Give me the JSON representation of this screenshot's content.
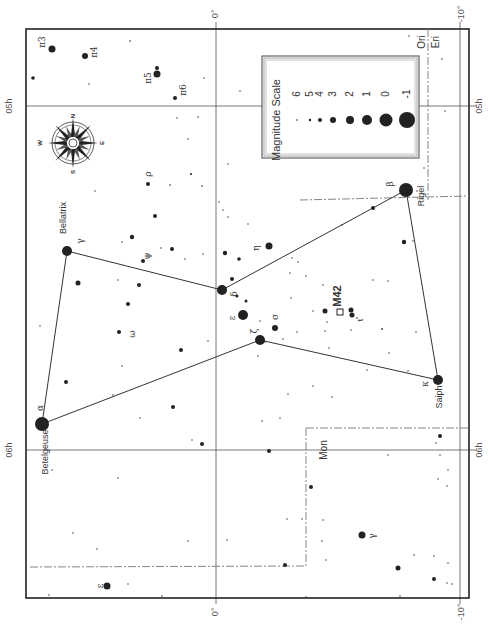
{
  "chart": {
    "constellation": "Orion",
    "frame": {
      "x": 26,
      "y": 29,
      "w": 443,
      "h": 569
    },
    "colors": {
      "ink": "#222222",
      "grid": "#555555",
      "boundary": "#777777",
      "paper": "#ffffff"
    }
  },
  "axes": {
    "dec_labels": [
      {
        "text": "0°",
        "x": 216,
        "y": 14,
        "rot": -90
      },
      {
        "text": "-10°",
        "x": 462,
        "y": 14,
        "rot": -90
      },
      {
        "text": "0°",
        "x": 216,
        "y": 612,
        "rot": -90
      },
      {
        "text": "-10°",
        "x": 462,
        "y": 612,
        "rot": -90
      }
    ],
    "ra_labels": [
      {
        "text": "05h",
        "x": 10,
        "y": 106,
        "rot": -90
      },
      {
        "text": "06h",
        "x": 10,
        "y": 450,
        "rot": -90
      },
      {
        "text": "05h",
        "x": 480,
        "y": 106,
        "rot": -90
      },
      {
        "text": "06h",
        "x": 480,
        "y": 450,
        "rot": -90
      }
    ],
    "grid_lines": [
      {
        "x1": 216,
        "y1": 22,
        "x2": 216,
        "y2": 604
      },
      {
        "x1": 26,
        "y1": 106,
        "x2": 476,
        "y2": 106
      },
      {
        "x1": 26,
        "y1": 450,
        "x2": 476,
        "y2": 450
      },
      {
        "x1": 460,
        "y1": 22,
        "x2": 460,
        "y2": 604
      }
    ]
  },
  "constellation_labels": [
    {
      "text": "Ori",
      "x": 422,
      "y": 42,
      "rot": -90
    },
    {
      "text": "Eri",
      "x": 436,
      "y": 42,
      "rot": -90
    },
    {
      "text": "Mon",
      "x": 324,
      "y": 450,
      "rot": -90
    }
  ],
  "boundaries": [
    {
      "points": "428,29 428,200"
    },
    {
      "points": "300,200 469,196"
    },
    {
      "points": "306,428 469,428"
    },
    {
      "points": "306,428 306,566"
    },
    {
      "points": "30,567 306,566"
    }
  ],
  "stick_lines": [
    {
      "from": "Betelgeuse",
      "to": "Bellatrix",
      "x1": 42,
      "y1": 424,
      "x2": 67,
      "y2": 251
    },
    {
      "from": "Bellatrix",
      "to": "Mintaka",
      "x1": 67,
      "y1": 251,
      "x2": 222,
      "y2": 290
    },
    {
      "from": "Mintaka",
      "to": "Rigel",
      "x1": 222,
      "y1": 290,
      "x2": 406,
      "y2": 190
    },
    {
      "from": "Rigel",
      "to": "Saiph",
      "x1": 406,
      "y1": 190,
      "x2": 438,
      "y2": 380
    },
    {
      "from": "Saiph",
      "to": "Alnitak",
      "x1": 438,
      "y1": 380,
      "x2": 260,
      "y2": 340
    },
    {
      "from": "Alnitak",
      "to": "Betelgeuse",
      "x1": 260,
      "y1": 340,
      "x2": 42,
      "y2": 424
    }
  ],
  "named_stars": [
    {
      "name": "Betelgeuse",
      "greek": "α",
      "x": 42,
      "y": 424,
      "r": 7,
      "label_x": 46,
      "label_y": 452,
      "greek_x": 40,
      "greek_y": 408
    },
    {
      "name": "Bellatrix",
      "greek": "γ",
      "x": 67,
      "y": 251,
      "r": 5,
      "label_x": 64,
      "label_y": 218,
      "greek_x": 80,
      "greek_y": 241
    },
    {
      "name": "Rigel",
      "greek": "β",
      "x": 406,
      "y": 190,
      "r": 7,
      "label_x": 422,
      "label_y": 196,
      "greek_x": 390,
      "greek_y": 184
    },
    {
      "name": "Saiph",
      "greek": "κ",
      "x": 438,
      "y": 380,
      "r": 5,
      "label_x": 440,
      "label_y": 397,
      "greek_x": 425,
      "greek_y": 384
    }
  ],
  "labeled_stars": [
    {
      "greek": "δ",
      "x": 222,
      "y": 290,
      "r": 5,
      "label_x": 234,
      "label_y": 294
    },
    {
      "greek": "ε",
      "x": 243,
      "y": 315,
      "r": 5,
      "label_x": 232,
      "label_y": 318
    },
    {
      "greek": "ζ",
      "x": 260,
      "y": 340,
      "r": 5,
      "label_x": 254,
      "label_y": 331
    },
    {
      "greek": "σ",
      "x": 275,
      "y": 328,
      "r": 3,
      "label_x": 275,
      "label_y": 317
    },
    {
      "greek": "η",
      "x": 269,
      "y": 246,
      "r": 3.5,
      "label_x": 256,
      "label_y": 248
    },
    {
      "greek": "ι",
      "x": 352,
      "y": 315,
      "r": 2.5,
      "label_x": 360,
      "label_y": 320
    },
    {
      "greek": "ψ",
      "x": 143,
      "y": 261,
      "r": 2,
      "label_x": 147,
      "label_y": 256
    },
    {
      "greek": "ω",
      "x": 119,
      "y": 332,
      "r": 2,
      "label_x": 132,
      "label_y": 334
    },
    {
      "greek": "ρ",
      "x": 148,
      "y": 184,
      "r": 2,
      "label_x": 148,
      "label_y": 174
    },
    {
      "greek": "π3",
      "x": 52,
      "y": 49,
      "r": 3.5,
      "label_x": 42,
      "label_y": 42
    },
    {
      "greek": "π4",
      "x": 85,
      "y": 56,
      "r": 3,
      "label_x": 94,
      "label_y": 52
    },
    {
      "greek": "π5",
      "x": 157,
      "y": 74,
      "r": 3.5,
      "label_x": 148,
      "label_y": 78
    },
    {
      "greek": "π6",
      "x": 175,
      "y": 98,
      "r": 2,
      "label_x": 183,
      "label_y": 90
    },
    {
      "greek": "ε",
      "x": 107,
      "y": 586,
      "r": 3.5,
      "label_x": 100,
      "label_y": 586
    },
    {
      "greek": "γ",
      "x": 362,
      "y": 535,
      "r": 3.5,
      "label_x": 372,
      "label_y": 536
    }
  ],
  "faint_stars": [
    [
      33,
      78,
      1.8
    ],
    [
      130,
      41,
      0.8
    ],
    [
      89,
      84,
      0.7
    ],
    [
      157,
      68,
      2
    ],
    [
      204,
      78,
      0.7
    ],
    [
      240,
      91,
      0.7
    ],
    [
      177,
      118,
      0.7
    ],
    [
      198,
      117,
      0.7
    ],
    [
      188,
      139,
      0.7
    ],
    [
      228,
      164,
      0.7
    ],
    [
      191,
      174,
      1
    ],
    [
      170,
      185,
      0.8
    ],
    [
      202,
      186,
      0.8
    ],
    [
      95,
      191,
      0.7
    ],
    [
      155,
      216,
      2
    ],
    [
      132,
      237,
      2.2
    ],
    [
      172,
      249,
      2
    ],
    [
      122,
      242,
      0.7
    ],
    [
      161,
      248,
      0.7
    ],
    [
      185,
      259,
      0.7
    ],
    [
      203,
      254,
      0.7
    ],
    [
      78,
      283,
      2.5
    ],
    [
      118,
      280,
      0.7
    ],
    [
      139,
      285,
      2
    ],
    [
      128,
      304,
      2
    ],
    [
      40,
      326,
      0.7
    ],
    [
      181,
      350,
      2
    ],
    [
      208,
      341,
      0.7
    ],
    [
      66,
      382,
      2
    ],
    [
      122,
      366,
      0.7
    ],
    [
      113,
      395,
      0.7
    ],
    [
      173,
      407,
      2
    ],
    [
      140,
      418,
      0.7
    ],
    [
      202,
      444,
      2
    ],
    [
      192,
      440,
      0.7
    ],
    [
      52,
      470,
      0.7
    ],
    [
      118,
      478,
      0.7
    ],
    [
      73,
      533,
      0.7
    ],
    [
      97,
      549,
      0.7
    ],
    [
      188,
      541,
      0.7
    ],
    [
      227,
      540,
      0.7
    ],
    [
      262,
      421,
      0.7
    ],
    [
      49,
      595,
      0.7
    ],
    [
      162,
      596,
      0.7
    ],
    [
      128,
      584,
      0.7
    ],
    [
      225,
      253,
      2.2
    ],
    [
      239,
      259,
      1.8
    ],
    [
      223,
      210,
      0.7
    ],
    [
      219,
      202,
      0.7
    ],
    [
      228,
      217,
      0.7
    ],
    [
      248,
      224,
      0.7
    ],
    [
      232,
      279,
      2
    ],
    [
      237,
      296,
      1.5
    ],
    [
      246,
      301,
      1.5
    ],
    [
      260,
      321,
      0.7
    ],
    [
      265,
      342,
      0.7
    ],
    [
      258,
      356,
      0.7
    ],
    [
      283,
      339,
      0.7
    ],
    [
      297,
      332,
      0.7
    ],
    [
      292,
      258,
      0.7
    ],
    [
      290,
      273,
      0.7
    ],
    [
      306,
      276,
      0.7
    ],
    [
      291,
      298,
      0.7
    ],
    [
      323,
      285,
      0.7
    ],
    [
      298,
      262,
      0.7
    ],
    [
      325,
      311,
      2.5
    ],
    [
      351,
      310,
      2.5
    ],
    [
      357,
      318,
      0.8
    ],
    [
      327,
      322,
      0.7
    ],
    [
      313,
      311,
      0.7
    ],
    [
      325,
      331,
      0.7
    ],
    [
      351,
      330,
      0.7
    ],
    [
      373,
      208,
      2
    ],
    [
      342,
      225,
      0.7
    ],
    [
      373,
      280,
      0.7
    ],
    [
      388,
      281,
      0.7
    ],
    [
      404,
      242,
      2.2
    ],
    [
      413,
      241,
      0.7
    ],
    [
      382,
      329,
      0.7
    ],
    [
      382,
      329,
      0.7
    ],
    [
      367,
      370,
      0.7
    ],
    [
      329,
      348,
      0.7
    ],
    [
      416,
      332,
      0.7
    ],
    [
      408,
      371,
      0.7
    ],
    [
      389,
      353,
      0.7
    ],
    [
      313,
      386,
      0.7
    ],
    [
      332,
      397,
      0.7
    ],
    [
      288,
      394,
      0.7
    ],
    [
      280,
      418,
      0.7
    ],
    [
      388,
      455,
      0.7
    ],
    [
      440,
      436,
      2
    ],
    [
      436,
      443,
      0.7
    ],
    [
      438,
      479,
      0.7
    ],
    [
      447,
      486,
      0.7
    ],
    [
      440,
      455,
      0.7
    ],
    [
      269,
      451,
      2
    ],
    [
      311,
      487,
      2
    ],
    [
      287,
      519,
      0.7
    ],
    [
      323,
      520,
      0.7
    ],
    [
      302,
      519,
      0.7
    ],
    [
      322,
      541,
      0.7
    ],
    [
      326,
      560,
      0.7
    ],
    [
      285,
      565,
      2
    ],
    [
      398,
      568,
      2.5
    ],
    [
      414,
      555,
      0.7
    ],
    [
      434,
      556,
      0.7
    ],
    [
      434,
      579,
      2
    ],
    [
      452,
      584,
      0.7
    ],
    [
      306,
      597,
      0.7
    ],
    [
      400,
      596,
      0.7
    ],
    [
      448,
      563,
      0.7
    ],
    [
      447,
      583,
      0.7
    ],
    [
      416,
      112,
      0.7
    ],
    [
      409,
      36,
      0.7
    ],
    [
      417,
      191,
      0.7
    ],
    [
      448,
      470,
      0.7
    ],
    [
      442,
      59,
      0.7
    ],
    [
      424,
      168,
      0.7
    ],
    [
      445,
      111,
      0.7
    ]
  ],
  "deep_sky": {
    "name": "M42",
    "x": 340,
    "y": 312,
    "size": 6,
    "label_x": 338,
    "label_y": 296
  },
  "compass": {
    "cx": 73,
    "cy": 143,
    "r": 21,
    "points": [
      {
        "text": "N",
        "x": 73,
        "y": 116
      },
      {
        "text": "S",
        "x": 73,
        "y": 172
      },
      {
        "text": "E",
        "x": 102,
        "y": 143
      },
      {
        "text": "W",
        "x": 40,
        "y": 143
      }
    ]
  },
  "legend": {
    "title": "Magnitude Scale",
    "box": {
      "x": 262,
      "y": 56,
      "w": 157,
      "h": 102
    },
    "entries": [
      {
        "mag": "6",
        "r": 0.8,
        "y": 97
      },
      {
        "mag": "5",
        "r": 1.2,
        "y": 109
      },
      {
        "mag": "4",
        "r": 2,
        "y": 120
      },
      {
        "mag": "3",
        "r": 3,
        "y": 133
      },
      {
        "mag": "2",
        "r": 4,
        "y": 150
      },
      {
        "mag": "1",
        "r": 5,
        "y": 167
      },
      {
        "mag": "0",
        "r": 6.5,
        "y": 186
      },
      {
        "mag": "-1",
        "r": 8,
        "y": 207
      }
    ]
  }
}
